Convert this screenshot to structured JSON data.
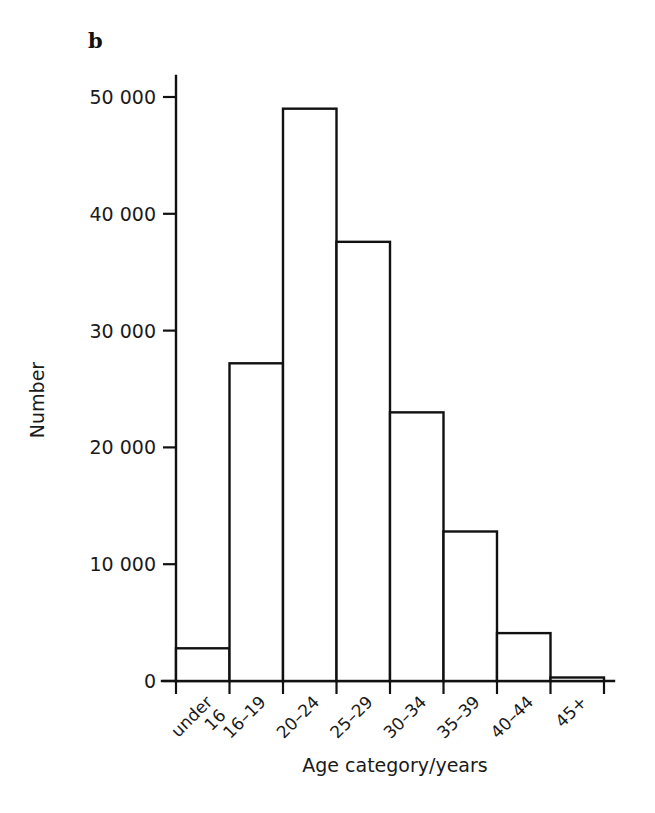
{
  "figure": {
    "panel_letter": "b",
    "background_color": "#ffffff",
    "ink_color": "#111111"
  },
  "chart_data": {
    "type": "bar",
    "title": "",
    "subtitle": "",
    "panel_label": "b",
    "categories": [
      "under 16",
      "16–19",
      "20–24",
      "25–29",
      "30–34",
      "35–39",
      "40–44",
      "45+"
    ],
    "category_lines": [
      [
        "under",
        "16"
      ],
      [
        "16–19"
      ],
      [
        "20–24"
      ],
      [
        "25–29"
      ],
      [
        "30–34"
      ],
      [
        "35–39"
      ],
      [
        "40–44"
      ],
      [
        "45+"
      ]
    ],
    "values": [
      2800,
      27200,
      49000,
      37600,
      23000,
      12800,
      4100,
      300
    ],
    "xlabel": "Age category/years",
    "ylabel": "Number",
    "ylim": [
      0,
      52000
    ],
    "yticks": [
      0,
      10000,
      20000,
      30000,
      40000,
      50000
    ],
    "ytick_labels": [
      "0",
      "10 000",
      "20 000",
      "30 000",
      "40 000",
      "50 000"
    ],
    "grid": false,
    "legend": null,
    "bar_fill": "#ffffff",
    "bar_edge": "#111111",
    "x_tick_rotation_degrees": -45
  }
}
